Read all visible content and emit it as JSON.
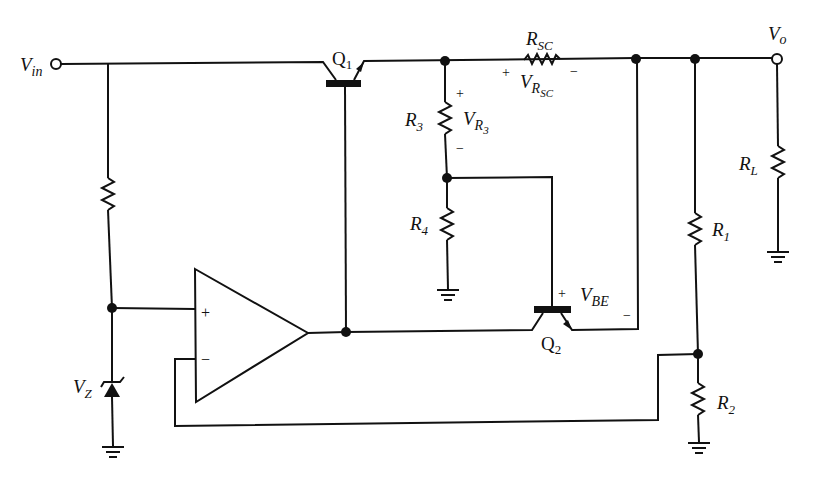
{
  "diagram": {
    "type": "circuit-schematic",
    "colors": {
      "line": "#111111",
      "background": "#ffffff"
    }
  },
  "terminals": {
    "input": {
      "main": "V",
      "sub": "in"
    },
    "output": {
      "main": "V",
      "sub": "o"
    }
  },
  "components": {
    "q1": {
      "label": "Q",
      "sub": "1",
      "kind": "npn-transistor"
    },
    "q2": {
      "label": "Q",
      "sub": "2",
      "kind": "npn-transistor"
    },
    "rsc": {
      "label": "R",
      "sub": "SC",
      "kind": "resistor"
    },
    "r3": {
      "label": "R",
      "sub": "3",
      "kind": "resistor"
    },
    "r4": {
      "label": "R",
      "sub": "4",
      "kind": "resistor"
    },
    "r1": {
      "label": "R",
      "sub": "1",
      "kind": "resistor"
    },
    "r2": {
      "label": "R",
      "sub": "2",
      "kind": "resistor"
    },
    "rl": {
      "label": "R",
      "sub": "L",
      "kind": "resistor"
    },
    "rz": {
      "label": "",
      "kind": "resistor"
    },
    "zener": {
      "label": "V",
      "sub": "Z",
      "kind": "zener-diode"
    },
    "opamp": {
      "plus": "+",
      "minus": "−",
      "kind": "op-amp"
    }
  },
  "voltages": {
    "vrsc": {
      "main": "V",
      "sub": "R",
      "subsub": "SC",
      "plus": "+",
      "minus": "−"
    },
    "vr3": {
      "main": "V",
      "sub": "R",
      "subsub": "3",
      "plus": "+",
      "minus": "−"
    },
    "vbe": {
      "main": "V",
      "sub": "BE",
      "plus": "+",
      "minus": "−"
    }
  }
}
